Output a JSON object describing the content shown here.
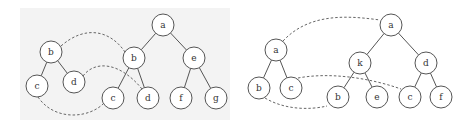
{
  "diagrams": [
    {
      "id": "left",
      "pattern": {
        "nodes": [
          {
            "id": "pb",
            "label": "b"
          },
          {
            "id": "pc",
            "label": "c"
          },
          {
            "id": "pd",
            "label": "d"
          }
        ],
        "edges": [
          [
            "pb",
            "pc"
          ],
          [
            "pb",
            "pd"
          ]
        ]
      },
      "target": {
        "nodes": [
          {
            "id": "ta",
            "label": "a"
          },
          {
            "id": "tb",
            "label": "b"
          },
          {
            "id": "te",
            "label": "e"
          },
          {
            "id": "tc",
            "label": "c"
          },
          {
            "id": "td",
            "label": "d"
          },
          {
            "id": "tf",
            "label": "f"
          },
          {
            "id": "tg",
            "label": "g"
          }
        ],
        "edges": [
          [
            "ta",
            "tb"
          ],
          [
            "ta",
            "te"
          ],
          [
            "tb",
            "tc"
          ],
          [
            "tb",
            "td"
          ],
          [
            "te",
            "tf"
          ],
          [
            "te",
            "tg"
          ]
        ]
      },
      "mappings": [
        [
          "pb",
          "tb"
        ],
        [
          "pd",
          "td"
        ],
        [
          "pc",
          "tc"
        ]
      ]
    },
    {
      "id": "right",
      "pattern": {
        "nodes": [
          {
            "id": "pa",
            "label": "a"
          },
          {
            "id": "pb",
            "label": "b"
          },
          {
            "id": "pc",
            "label": "c"
          }
        ],
        "edges": [
          [
            "pa",
            "pb"
          ],
          [
            "pa",
            "pc"
          ]
        ]
      },
      "target": {
        "nodes": [
          {
            "id": "ta",
            "label": "a"
          },
          {
            "id": "tk",
            "label": "k"
          },
          {
            "id": "td",
            "label": "d"
          },
          {
            "id": "tb",
            "label": "b"
          },
          {
            "id": "te",
            "label": "e"
          },
          {
            "id": "tc",
            "label": "c"
          },
          {
            "id": "tf",
            "label": "f"
          }
        ],
        "edges": [
          [
            "ta",
            "tk"
          ],
          [
            "ta",
            "td"
          ],
          [
            "tk",
            "tb"
          ],
          [
            "tk",
            "te"
          ],
          [
            "td",
            "tc"
          ],
          [
            "td",
            "tf"
          ]
        ]
      },
      "mappings": [
        [
          "pa",
          "ta"
        ],
        [
          "pc",
          "tc"
        ],
        [
          "pb",
          "tb"
        ]
      ]
    }
  ]
}
